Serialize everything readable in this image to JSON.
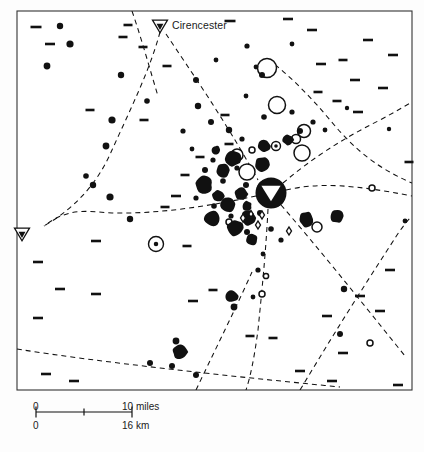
{
  "figure": {
    "type": "archaeological-distribution-map",
    "region": "Cotswolds / Upper Thames, Gloucestershire",
    "caption": "",
    "background_color": "#fdfdfd",
    "ink_color": "#111111"
  },
  "frame": {
    "x": 17,
    "y": 11,
    "width": 395,
    "height": 379,
    "stroke": "#333333",
    "stroke_width": 1.1
  },
  "places": [
    {
      "name": "Cirencester",
      "label": "Cirencester",
      "x": 160,
      "y": 26,
      "symbol": "town-triangle",
      "label_dx": 12,
      "label_dy": 1
    },
    {
      "name": "unnamed-town-west",
      "label": "",
      "x": 22,
      "y": 234,
      "symbol": "town-triangle",
      "label_dx": 0,
      "label_dy": 0
    }
  ],
  "hub": {
    "x": 271,
    "y": 193,
    "radius": 15.5,
    "symbol": "major-settlement-with-triangle"
  },
  "scale_bar": {
    "x": 36,
    "y": 412,
    "length": 96,
    "miles": {
      "zero": "0",
      "max": "10 miles",
      "ticks": 2
    },
    "km": {
      "zero": "0",
      "max": "16 km"
    }
  },
  "symbol_legend": [
    {
      "key": "filled-dot",
      "meaning": "small find-spot / site"
    },
    {
      "key": "large-filled-blob",
      "meaning": "major site cluster"
    },
    {
      "key": "open-circle",
      "meaning": "site of other class"
    },
    {
      "key": "circle-with-dot",
      "meaning": "enclosed site"
    },
    {
      "key": "short-dash",
      "meaning": "linear feature / cropmark"
    },
    {
      "key": "lozenge",
      "meaning": "small enclosure"
    },
    {
      "key": "dashed-line",
      "meaning": "Roman road"
    }
  ],
  "chart_data": {
    "type": "scatter",
    "title": "",
    "xlabel": "",
    "ylabel": "",
    "xlim": [
      17,
      412
    ],
    "ylim": [
      11,
      390
    ],
    "grid": false,
    "legend": "none",
    "series": [
      {
        "name": "filled-dots",
        "symbol": "filled-circle",
        "points": [
          {
            "x": 60,
            "y": 26,
            "r": 3.2
          },
          {
            "x": 70,
            "y": 44,
            "r": 3.6
          },
          {
            "x": 47,
            "y": 66,
            "r": 3.4
          },
          {
            "x": 121,
            "y": 75,
            "r": 3.2
          },
          {
            "x": 112,
            "y": 120,
            "r": 3.6
          },
          {
            "x": 106,
            "y": 146,
            "r": 3.4
          },
          {
            "x": 147,
            "y": 101,
            "r": 2.8
          },
          {
            "x": 196,
            "y": 80,
            "r": 3.0
          },
          {
            "x": 198,
            "y": 106,
            "r": 3.2
          },
          {
            "x": 183,
            "y": 131,
            "r": 2.6
          },
          {
            "x": 211,
            "y": 122,
            "r": 3.0
          },
          {
            "x": 229,
            "y": 130,
            "r": 3.2
          },
          {
            "x": 242,
            "y": 139,
            "r": 2.6
          },
          {
            "x": 256,
            "y": 67,
            "r": 2.4
          },
          {
            "x": 247,
            "y": 46,
            "r": 2.6
          },
          {
            "x": 292,
            "y": 44,
            "r": 2.4
          },
          {
            "x": 262,
            "y": 75,
            "r": 3.0
          },
          {
            "x": 264,
            "y": 117,
            "r": 2.8
          },
          {
            "x": 292,
            "y": 112,
            "r": 2.6
          },
          {
            "x": 300,
            "y": 131,
            "r": 3.0
          },
          {
            "x": 313,
            "y": 122,
            "r": 2.6
          },
          {
            "x": 325,
            "y": 130,
            "r": 2.4
          },
          {
            "x": 347,
            "y": 108,
            "r": 2.2
          },
          {
            "x": 213,
            "y": 160,
            "r": 2.6
          },
          {
            "x": 205,
            "y": 170,
            "r": 3.0
          },
          {
            "x": 223,
            "y": 181,
            "r": 2.8
          },
          {
            "x": 237,
            "y": 168,
            "r": 2.6
          },
          {
            "x": 246,
            "y": 185,
            "r": 3.0
          },
          {
            "x": 260,
            "y": 213,
            "r": 3.0
          },
          {
            "x": 271,
            "y": 229,
            "r": 2.8
          },
          {
            "x": 247,
            "y": 232,
            "r": 3.0
          },
          {
            "x": 231,
            "y": 216,
            "r": 2.6
          },
          {
            "x": 214,
            "y": 206,
            "r": 2.8
          },
          {
            "x": 196,
            "y": 198,
            "r": 2.6
          },
          {
            "x": 281,
            "y": 240,
            "r": 2.6
          },
          {
            "x": 263,
            "y": 254,
            "r": 2.4
          },
          {
            "x": 258,
            "y": 270,
            "r": 2.6
          },
          {
            "x": 130,
            "y": 219,
            "r": 3.2
          },
          {
            "x": 110,
            "y": 197,
            "r": 3.6
          },
          {
            "x": 93,
            "y": 185,
            "r": 3.2
          },
          {
            "x": 86,
            "y": 176,
            "r": 2.8
          },
          {
            "x": 150,
            "y": 363,
            "r": 3.0
          },
          {
            "x": 172,
            "y": 366,
            "r": 3.0
          },
          {
            "x": 196,
            "y": 375,
            "r": 3.0
          },
          {
            "x": 176,
            "y": 341,
            "r": 3.4
          },
          {
            "x": 234,
            "y": 307,
            "r": 3.4
          },
          {
            "x": 253,
            "y": 297,
            "r": 2.4
          },
          {
            "x": 344,
            "y": 289,
            "r": 3.2
          },
          {
            "x": 340,
            "y": 334,
            "r": 3.0
          },
          {
            "x": 389,
            "y": 129,
            "r": 2.2
          },
          {
            "x": 405,
            "y": 221,
            "r": 2.4
          },
          {
            "x": 216,
            "y": 60,
            "r": 2.4
          },
          {
            "x": 246,
            "y": 96,
            "r": 2.4
          },
          {
            "x": 192,
            "y": 149,
            "r": 2.4
          }
        ]
      },
      {
        "name": "large-filled-blobs",
        "symbol": "filled-blob",
        "points": [
          {
            "x": 204,
            "y": 185,
            "r": 9.0
          },
          {
            "x": 223,
            "y": 170,
            "r": 7.5
          },
          {
            "x": 233,
            "y": 158,
            "r": 8.5
          },
          {
            "x": 241,
            "y": 194,
            "r": 7.0
          },
          {
            "x": 218,
            "y": 196,
            "r": 6.0
          },
          {
            "x": 228,
            "y": 204,
            "r": 8.5
          },
          {
            "x": 212,
            "y": 218,
            "r": 8.0
          },
          {
            "x": 235,
            "y": 228,
            "r": 8.5
          },
          {
            "x": 248,
            "y": 218,
            "r": 7.5
          },
          {
            "x": 252,
            "y": 240,
            "r": 6.0
          },
          {
            "x": 271,
            "y": 193,
            "r": 15.0
          },
          {
            "x": 262,
            "y": 165,
            "r": 8.0
          },
          {
            "x": 264,
            "y": 146,
            "r": 6.5
          },
          {
            "x": 288,
            "y": 140,
            "r": 5.5
          },
          {
            "x": 306,
            "y": 219,
            "r": 8.0
          },
          {
            "x": 337,
            "y": 216,
            "r": 7.0
          },
          {
            "x": 232,
            "y": 296,
            "r": 6.5
          },
          {
            "x": 180,
            "y": 352,
            "r": 7.5
          },
          {
            "x": 247,
            "y": 206,
            "r": 5.0
          },
          {
            "x": 216,
            "y": 150,
            "r": 4.5
          }
        ]
      },
      {
        "name": "open-circles",
        "symbol": "open-circle",
        "points": [
          {
            "x": 267,
            "y": 68,
            "r": 9.5
          },
          {
            "x": 277,
            "y": 105,
            "r": 8.5
          },
          {
            "x": 302,
            "y": 153,
            "r": 8.0
          },
          {
            "x": 247,
            "y": 172,
            "r": 8.0
          },
          {
            "x": 237,
            "y": 155,
            "r": 6.0
          },
          {
            "x": 304,
            "y": 131,
            "r": 6.5
          },
          {
            "x": 296,
            "y": 139,
            "r": 4.5
          },
          {
            "x": 372,
            "y": 188,
            "r": 3.0
          },
          {
            "x": 370,
            "y": 343,
            "r": 3.0
          },
          {
            "x": 262,
            "y": 294,
            "r": 3.0
          },
          {
            "x": 266,
            "y": 276,
            "r": 2.6
          },
          {
            "x": 317,
            "y": 227,
            "r": 5.0
          },
          {
            "x": 229,
            "y": 222,
            "r": 3.0
          },
          {
            "x": 252,
            "y": 150,
            "r": 3.0
          }
        ]
      },
      {
        "name": "circle-with-dot",
        "symbol": "circle-dot",
        "points": [
          {
            "x": 156,
            "y": 244,
            "r": 7.5
          },
          {
            "x": 276,
            "y": 146,
            "r": 4.5
          }
        ]
      },
      {
        "name": "lozenges",
        "symbol": "lozenge",
        "points": [
          {
            "x": 243,
            "y": 218,
            "r": 4.0
          },
          {
            "x": 258,
            "y": 225,
            "r": 4.0
          },
          {
            "x": 262,
            "y": 215,
            "r": 4.0
          },
          {
            "x": 289,
            "y": 231,
            "r": 4.0
          },
          {
            "x": 251,
            "y": 214,
            "r": 3.4
          }
        ]
      },
      {
        "name": "short-dashes",
        "symbol": "dash",
        "points": [
          {
            "x": 36,
            "y": 27,
            "len": 11
          },
          {
            "x": 50,
            "y": 44,
            "len": 10
          },
          {
            "x": 123,
            "y": 37,
            "len": 9
          },
          {
            "x": 143,
            "y": 47,
            "len": 9
          },
          {
            "x": 128,
            "y": 25,
            "len": 9
          },
          {
            "x": 167,
            "y": 66,
            "len": 9
          },
          {
            "x": 230,
            "y": 21,
            "len": 11
          },
          {
            "x": 288,
            "y": 19,
            "len": 10
          },
          {
            "x": 312,
            "y": 30,
            "len": 10
          },
          {
            "x": 321,
            "y": 64,
            "len": 10
          },
          {
            "x": 343,
            "y": 60,
            "len": 9
          },
          {
            "x": 355,
            "y": 80,
            "len": 10
          },
          {
            "x": 368,
            "y": 40,
            "len": 10
          },
          {
            "x": 393,
            "y": 55,
            "len": 10
          },
          {
            "x": 383,
            "y": 88,
            "len": 10
          },
          {
            "x": 358,
            "y": 112,
            "len": 10
          },
          {
            "x": 337,
            "y": 101,
            "len": 9
          },
          {
            "x": 318,
            "y": 92,
            "len": 9
          },
          {
            "x": 225,
            "y": 115,
            "len": 9
          },
          {
            "x": 229,
            "y": 144,
            "len": 9
          },
          {
            "x": 200,
            "y": 157,
            "len": 9
          },
          {
            "x": 185,
            "y": 175,
            "len": 9
          },
          {
            "x": 176,
            "y": 196,
            "len": 10
          },
          {
            "x": 165,
            "y": 207,
            "len": 9
          },
          {
            "x": 96,
            "y": 241,
            "len": 10
          },
          {
            "x": 38,
            "y": 262,
            "len": 10
          },
          {
            "x": 60,
            "y": 289,
            "len": 10
          },
          {
            "x": 96,
            "y": 294,
            "len": 10
          },
          {
            "x": 38,
            "y": 318,
            "len": 10
          },
          {
            "x": 74,
            "y": 381,
            "len": 10
          },
          {
            "x": 46,
            "y": 374,
            "len": 10
          },
          {
            "x": 193,
            "y": 301,
            "len": 10
          },
          {
            "x": 213,
            "y": 290,
            "len": 9
          },
          {
            "x": 250,
            "y": 336,
            "len": 9
          },
          {
            "x": 273,
            "y": 338,
            "len": 9
          },
          {
            "x": 327,
            "y": 316,
            "len": 10
          },
          {
            "x": 343,
            "y": 353,
            "len": 10
          },
          {
            "x": 360,
            "y": 296,
            "len": 10
          },
          {
            "x": 380,
            "y": 311,
            "len": 10
          },
          {
            "x": 390,
            "y": 270,
            "len": 10
          },
          {
            "x": 300,
            "y": 371,
            "len": 10
          },
          {
            "x": 332,
            "y": 381,
            "len": 10
          },
          {
            "x": 398,
            "y": 385,
            "len": 10
          },
          {
            "x": 409,
            "y": 162,
            "len": 9
          },
          {
            "x": 187,
            "y": 246,
            "len": 9
          },
          {
            "x": 144,
            "y": 120,
            "len": 9
          },
          {
            "x": 90,
            "y": 110,
            "len": 9
          }
        ]
      }
    ],
    "roads": [
      {
        "name": "road-north-from-cirencester",
        "path": "M 160 32 C 150 70, 130 110, 112 150 C 100 178, 80 205, 44 226"
      },
      {
        "name": "road-cirencester-to-hub",
        "path": "M 166 34 C 190 70, 225 120, 258 180"
      },
      {
        "name": "road-hub-east",
        "path": "M 286 190 C 320 182, 355 185, 412 196"
      },
      {
        "name": "road-hub-west",
        "path": "M 256 196 C 210 206, 160 214, 112 213 C 90 212, 70 206, 44 226"
      },
      {
        "name": "road-hub-southeast",
        "path": "M 281 205 C 320 250, 360 300, 405 356"
      },
      {
        "name": "road-hub-south",
        "path": "M 268 209 C 266 250, 262 290, 258 330 C 254 360, 250 378, 246 390"
      },
      {
        "name": "road-hub-northeast",
        "path": "M 283 183 C 310 160, 340 140, 380 120 C 395 112, 405 106, 412 102"
      },
      {
        "name": "road-southwest-diagonal",
        "path": "M 17 349 C 60 356, 110 362, 160 368 C 220 375, 280 381, 340 387"
      },
      {
        "name": "road-south-cross",
        "path": "M 196 390 C 215 350, 235 310, 252 272"
      },
      {
        "name": "road-east-lower",
        "path": "M 300 390 C 330 340, 360 292, 390 246 C 400 230, 406 222, 412 216"
      },
      {
        "name": "road-north-upper-right",
        "path": "M 268 59 C 290 76, 310 96, 330 120 C 350 144, 372 166, 412 183"
      },
      {
        "name": "road-upper-left-diag",
        "path": "M 132 11 C 142 40, 150 70, 158 96"
      }
    ]
  }
}
